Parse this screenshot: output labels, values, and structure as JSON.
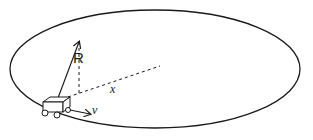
{
  "diagram": {
    "track": {
      "shape": "ellipse",
      "cx": 155,
      "cy": 69,
      "rx": 145,
      "ry": 59
    },
    "labels": {
      "position_vector": "R",
      "displacement": "x",
      "velocity": "v"
    },
    "colors": {
      "stroke": "#1a1a1a",
      "background": "#ffffff"
    }
  }
}
